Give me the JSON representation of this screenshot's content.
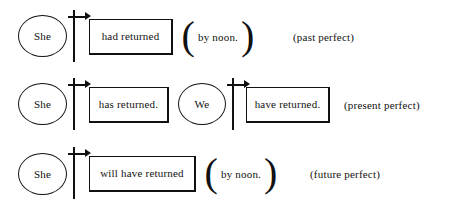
{
  "figure": {
    "background_color": "#ffffff",
    "ink_color": "#111111"
  },
  "rows": [
    {
      "id": "past-perfect",
      "subject": "She",
      "marker": "time-marker-arrow",
      "verb": "had returned",
      "adverbial_open": "(",
      "adverbial": "by noon.",
      "adverbial_close": ")",
      "tense": "(past perfect)"
    },
    {
      "id": "present-perfect",
      "subject": "She",
      "marker": "time-marker-arrow",
      "verb": "has returned.",
      "subject2": "We",
      "marker2": "time-marker-arrow",
      "verb2": "have returned.",
      "tense": "(present perfect)"
    },
    {
      "id": "future-perfect",
      "subject": "She",
      "marker": "time-marker-arrow",
      "verb": "will have returned",
      "adverbial_open": "(",
      "adverbial": "by noon.",
      "adverbial_close": ")",
      "tense": "(future perfect)"
    }
  ]
}
